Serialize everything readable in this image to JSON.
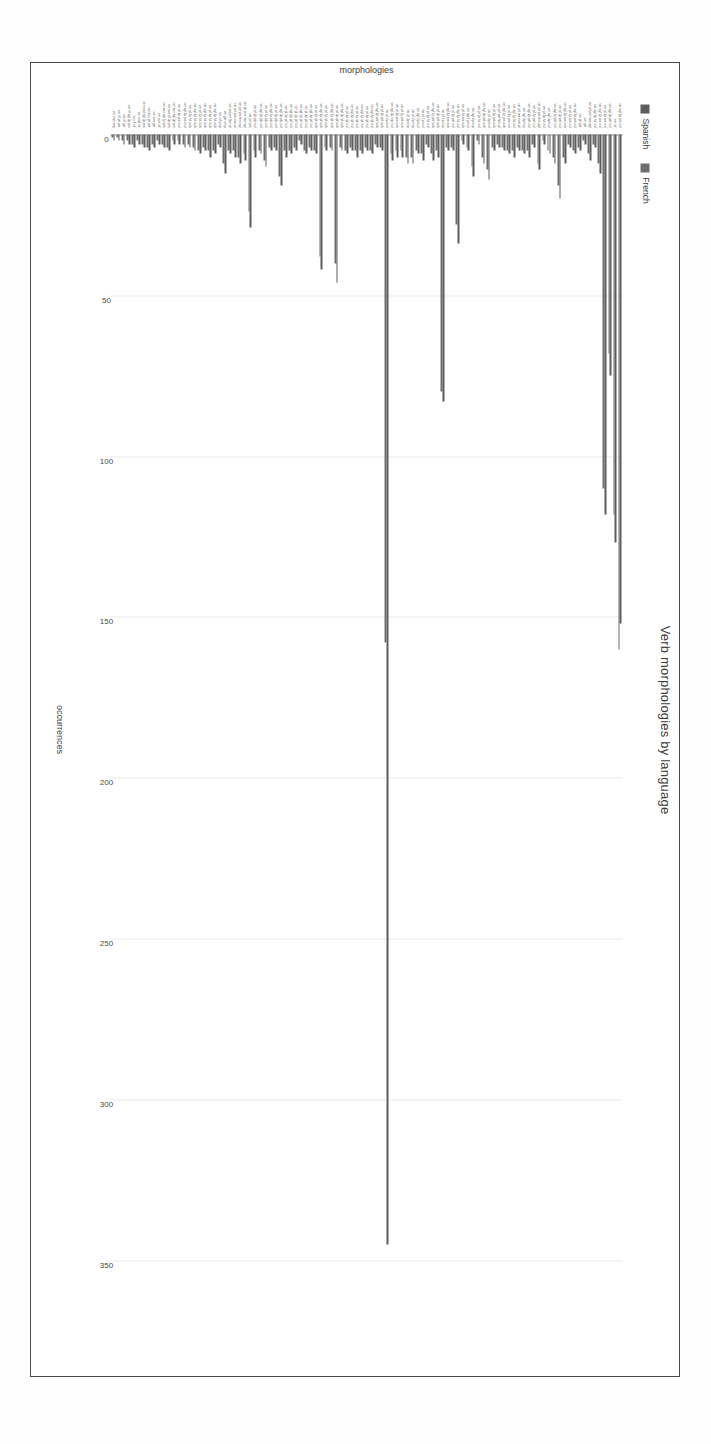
{
  "chart_data": {
    "type": "bar",
    "orientation": "horizontal",
    "title": "Verb morphologies by language",
    "xlabel": "occurrences",
    "ylabel": "morphologies",
    "xlim": [
      0,
      370
    ],
    "xticks": [
      0,
      50,
      100,
      150,
      200,
      250,
      300,
      350
    ],
    "grid": true,
    "legend_position": "top-left",
    "rotation_degrees": 90,
    "colors": {
      "Spanish": "#5d5d5d",
      "French": "#6e6e6e",
      "grid": "#e9e9e9",
      "axis": "#9a9a9a",
      "text": "#3d3d3d"
    },
    "categories": [
      "ver sgl 3p prs ind",
      "ver inf",
      "ver sgl 3p pst ind",
      "ver pl 3p prs ind",
      "ver sgl 1p prs ind",
      "ver sgl 3p fut ind",
      "ver prt pst msc sgl",
      "ver ger",
      "ver prt pst",
      "ver sgl 2p prs ind",
      "ver pl 1p prs ind",
      "ver sgl 3p prs sub",
      "ver pl 3p pst ind",
      "ver sgl 1p pst ind",
      "ver sgl 3p cnd",
      "ver pl 3p fut ind",
      "ver prt pst fem sgl",
      "ver pl 1p pst ind",
      "ver sgl 2p pst ind",
      "ver sgl 3p imp",
      "ver prt pst msc pl",
      "ver sgl 1p fut ind",
      "ver pl 2p prs ind",
      "ver sgl 1p prs sub",
      "ver prt pst fem pl",
      "ver pl 3p prs sub",
      "ver pl 3p cnd",
      "ver sgl 3p pst sub",
      "ver pl 1p fut ind",
      "ver sgl 2p imp",
      "ver sgl 1p cnd",
      "ver pl 1p prs sub",
      "ver sgl 2p fut ind",
      "ver pl 2p pst ind",
      "ver sgl 2p prs sub",
      "ver pl 1p imp",
      "ver pl 3p pst sub",
      "ver sgl 1p pst sub",
      "ver pl 2p fut ind",
      "ver pl 1p cnd",
      "ver sgl 2p cnd",
      "ver pl 2p imp",
      "ver pl 3p imp",
      "ver pl 1p pst sub",
      "ver pl 2p prs sub",
      "ver sgl 3p imp ind",
      "ver pl 2p cnd",
      "ver pl 2p pst sub",
      "ver sgl 2p pst sub",
      "ver sgl 3p ipf ind",
      "ver pl 3p ipf ind",
      "ver sgl 1p ipf ind",
      "ver pl 1p ipf ind",
      "ver sgl 2p ipf ind",
      "ver pl 2p ipf ind",
      "ver sgl 3p ipf sub",
      "ver pl 3p ipf sub",
      "ver sgl 1p ipf sub",
      "ver pl 1p ipf sub",
      "ver sgl 2p ipf sub",
      "ver pl 2p ipf sub",
      "ver sgl 3p prf ind",
      "ver pl 3p prf ind",
      "ver sgl 1p prf ind",
      "ver pl 1p prf ind",
      "ver sgl 2p prf ind",
      "ver pl 2p prf ind",
      "ver sgl 3p plp ind",
      "ver pl 3p plp ind",
      "ver sgl 1p plp ind",
      "ver pl 1p plp ind",
      "ver sgl 2p plp ind",
      "ver pl 2p plp ind",
      "ver prt prs",
      "ver prt prs msc sgl",
      "ver prt prs fem sgl",
      "ver prt prs msc pl",
      "ver prt prs fem pl",
      "ver ger cmp",
      "ver inf cmp",
      "ver sgl 3p fut sub",
      "ver pl 3p fut sub",
      "ver sgl 1p fut sub",
      "ver pl 1p fut sub",
      "ver sgl 2p fut sub",
      "ver pl 2p fut sub",
      "ver sgl 3p prs cnd",
      "ver pl 3p prs cnd",
      "ver aux sgl 3p prs",
      "ver aux pl 3p prs",
      "ver aux sgl 1p prs",
      "ver aux inf",
      "ver aux ger",
      "ver aux prt pst",
      "ver mod sgl 3p prs",
      "ver mod inf",
      "ver rfl inf",
      "ver rfl sgl 3p prs",
      "ver rfl ger",
      "ver rfl prt pst",
      "ver imp neg"
    ],
    "series": [
      {
        "name": "Spanish",
        "color": "#5d5d5d",
        "values": [
          152,
          127,
          75,
          118,
          12,
          4,
          8,
          3,
          5,
          6,
          4,
          9,
          20,
          9,
          6,
          3,
          11,
          4,
          7,
          6,
          5,
          7,
          6,
          5,
          4,
          5,
          14,
          9,
          3,
          13,
          5,
          3,
          34,
          5,
          5,
          83,
          7,
          8,
          4,
          8,
          6,
          9,
          9,
          7,
          7,
          8,
          345,
          5,
          4,
          6,
          5,
          6,
          7,
          5,
          6,
          5,
          46,
          5,
          5,
          42,
          6,
          5,
          6,
          3,
          5,
          6,
          7,
          16,
          5,
          5,
          10,
          6,
          7,
          29,
          8,
          9,
          7,
          6,
          12,
          4,
          6,
          7,
          5,
          6,
          5,
          4,
          4,
          3,
          3,
          5,
          4,
          3,
          4,
          5,
          4,
          3,
          4,
          3,
          3,
          2,
          2
        ]
      },
      {
        "name": "French",
        "color": "#6e6e6e",
        "values": [
          160,
          118,
          68,
          110,
          9,
          3,
          6,
          2,
          4,
          5,
          3,
          7,
          16,
          7,
          5,
          2,
          9,
          3,
          5,
          5,
          4,
          5,
          5,
          4,
          3,
          4,
          11,
          7,
          2,
          10,
          4,
          2,
          28,
          4,
          4,
          80,
          5,
          6,
          3,
          6,
          5,
          7,
          7,
          5,
          5,
          6,
          158,
          4,
          3,
          5,
          4,
          5,
          5,
          4,
          5,
          4,
          40,
          4,
          4,
          38,
          5,
          4,
          5,
          2,
          4,
          5,
          5,
          13,
          4,
          4,
          8,
          5,
          5,
          24,
          6,
          7,
          5,
          5,
          9,
          3,
          5,
          5,
          4,
          5,
          4,
          3,
          3,
          2,
          2,
          4,
          3,
          2,
          3,
          4,
          3,
          2,
          3,
          2,
          2,
          1,
          1
        ]
      }
    ]
  },
  "legend": {
    "items": [
      {
        "label": "Spanish",
        "color": "#5d5d5d"
      },
      {
        "label": "French",
        "color": "#6e6e6e"
      }
    ]
  }
}
